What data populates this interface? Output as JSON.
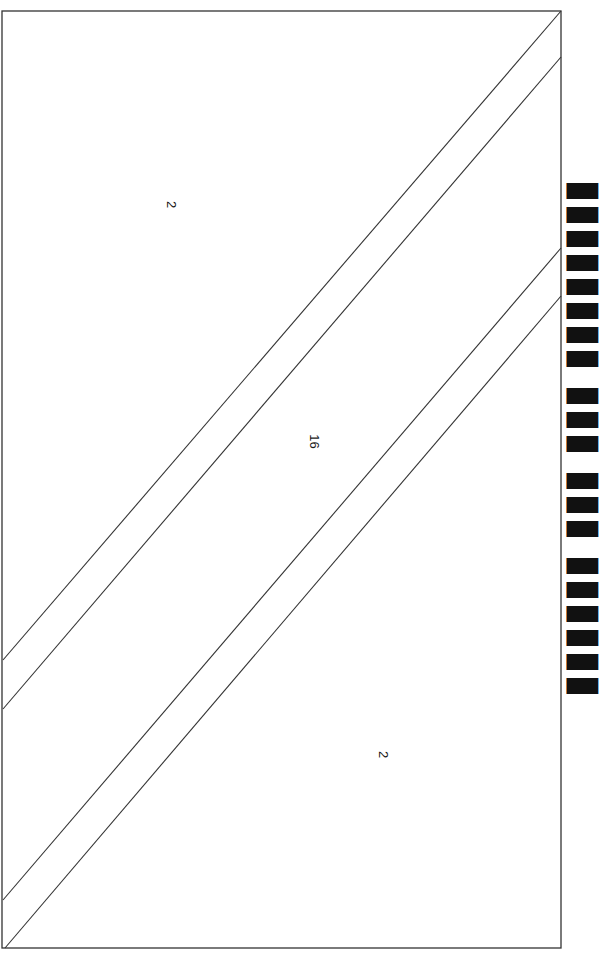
{
  "diagram": {
    "type": "paint-by-number pattern",
    "orientation": "rotated 90deg",
    "frame": {
      "x1": 2,
      "y1": 11,
      "x2": 561,
      "y2": 948,
      "stroke": "#333333"
    },
    "lines": [
      {
        "x1": 561,
        "y1": 11,
        "x2": 3,
        "y2": 660
      },
      {
        "x1": 561,
        "y1": 57,
        "x2": 3,
        "y2": 709
      },
      {
        "x1": 561,
        "y1": 248,
        "x2": 3,
        "y2": 900
      },
      {
        "x1": 561,
        "y1": 296,
        "x2": 5,
        "y2": 948
      }
    ],
    "labels": [
      {
        "text": "2",
        "x": 174,
        "y": 205
      },
      {
        "text": "16",
        "x": 313,
        "y": 442
      },
      {
        "text": "2",
        "x": 386,
        "y": 755
      }
    ],
    "title_clipped": "▮▮▮▮▮▮▮▮ ▮▮▮ ▮▮▮ ▮▮▮▮▮▮"
  }
}
